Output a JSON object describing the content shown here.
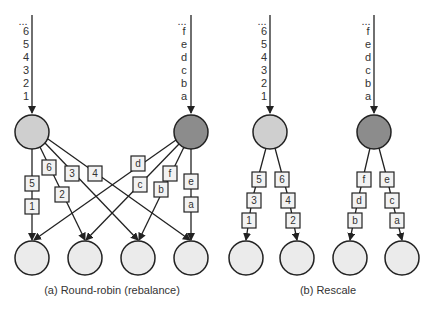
{
  "colors": {
    "source_light": "#cfcfcf",
    "source_dark": "#8c8c8c",
    "sink": "#ebebeb",
    "line": "#222222"
  },
  "panels": [
    {
      "id": "a",
      "caption": "(a) Round-robin (rebalance)",
      "sources": [
        {
          "shade": "light",
          "stream": [
            "...",
            "6",
            "5",
            "4",
            "3",
            "2",
            "1"
          ]
        },
        {
          "shade": "dark",
          "stream": [
            "...",
            "f",
            "e",
            "d",
            "c",
            "b",
            "a"
          ]
        }
      ],
      "edges": [
        {
          "from": "light",
          "to_sink": 1,
          "records": [
            "5",
            "1"
          ]
        },
        {
          "from": "light",
          "to_sink": 2,
          "records": [
            "6",
            "2"
          ]
        },
        {
          "from": "light",
          "to_sink": 3,
          "records": [
            "3"
          ]
        },
        {
          "from": "light",
          "to_sink": 4,
          "records": [
            "4"
          ]
        },
        {
          "from": "dark",
          "to_sink": 1,
          "records": [
            "d"
          ]
        },
        {
          "from": "dark",
          "to_sink": 2,
          "records": [
            "c"
          ]
        },
        {
          "from": "dark",
          "to_sink": 3,
          "records": [
            "f",
            "b"
          ]
        },
        {
          "from": "dark",
          "to_sink": 4,
          "records": [
            "e",
            "a"
          ]
        }
      ],
      "sink_count": 4
    },
    {
      "id": "b",
      "caption": "(b) Rescale",
      "sources": [
        {
          "shade": "light",
          "stream": [
            "...",
            "6",
            "5",
            "4",
            "3",
            "2",
            "1"
          ]
        },
        {
          "shade": "dark",
          "stream": [
            "...",
            "f",
            "e",
            "d",
            "c",
            "b",
            "a"
          ]
        }
      ],
      "edges": [
        {
          "from": "light",
          "to_sink": 1,
          "records": [
            "5",
            "3",
            "1"
          ]
        },
        {
          "from": "light",
          "to_sink": 2,
          "records": [
            "6",
            "4",
            "2"
          ]
        },
        {
          "from": "dark",
          "to_sink": 3,
          "records": [
            "f",
            "d",
            "b"
          ]
        },
        {
          "from": "dark",
          "to_sink": 4,
          "records": [
            "e",
            "c",
            "a"
          ]
        }
      ],
      "sink_count": 4
    }
  ]
}
